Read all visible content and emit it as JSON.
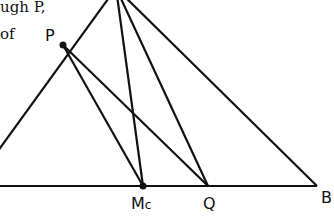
{
  "text_fragments": [
    {
      "id": "line1",
      "text": "ugh P,",
      "x": 0,
      "y": -2
    },
    {
      "id": "line2",
      "text": "of",
      "x": 0,
      "y": 25
    }
  ],
  "points": {
    "A": {
      "x": 116,
      "y": -12,
      "label": ""
    },
    "P": {
      "x": 63,
      "y": 45,
      "label": "P",
      "label_x": 45,
      "label_y": 28
    },
    "Mc": {
      "x": 143,
      "y": 186,
      "label": "M",
      "sub": "c",
      "label_x": 132,
      "label_y": 193
    },
    "Q": {
      "x": 208,
      "y": 186,
      "label": "Q",
      "label_x": 204,
      "label_y": 193
    },
    "B": {
      "x": 317,
      "y": 186,
      "label": "B",
      "label_x": 320,
      "label_y": 188
    },
    "L": {
      "x": -10,
      "y": 162,
      "label": ""
    },
    "BL": {
      "x": -10,
      "y": 186,
      "label": ""
    }
  },
  "segments": [
    [
      "A",
      "L"
    ],
    [
      "BL",
      "B"
    ],
    [
      "A",
      "B"
    ],
    [
      "A",
      "Mc"
    ],
    [
      "A",
      "Q"
    ],
    [
      "P",
      "Mc"
    ],
    [
      "P",
      "Q"
    ]
  ],
  "dots": [
    "P",
    "Mc"
  ],
  "colors": {
    "line": "#111111",
    "background": "#ffffff"
  }
}
